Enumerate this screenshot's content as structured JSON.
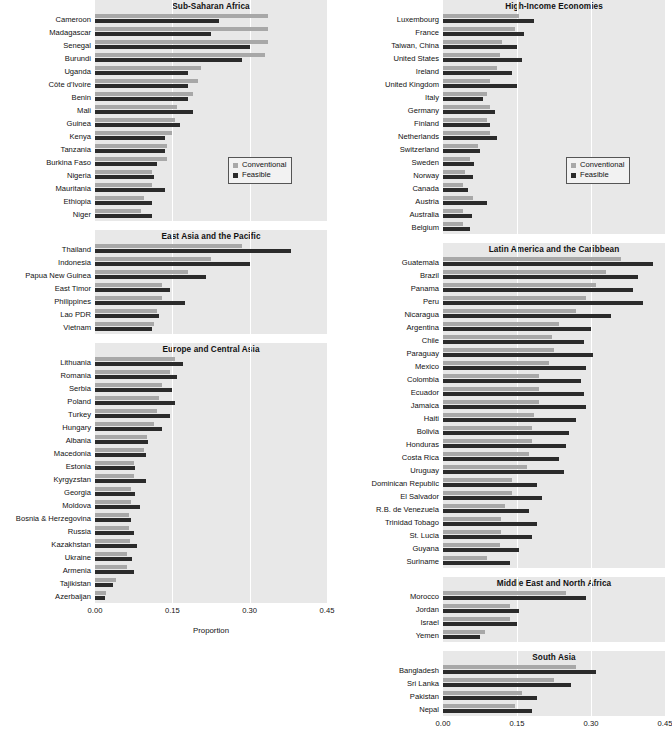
{
  "axis": {
    "xlabel": "Proportion",
    "ticks": [
      "0.00",
      "0.15",
      "0.30",
      "0.45"
    ],
    "tick_values": [
      0,
      0.15,
      0.3,
      0.45
    ],
    "xmin": 0,
    "xmax": 0.45
  },
  "legend": {
    "conventional": "Conventional",
    "feasible": "Feasible"
  },
  "colors": {
    "conventional": "#a8a8a8",
    "feasible": "#2b2b2b",
    "panel_background": "#e8e8e8",
    "gridline": "#ffffff"
  },
  "chart_data": {
    "type": "bar",
    "orientation": "horizontal",
    "title": "",
    "xlabel": "Proportion",
    "ylabel": "",
    "xlim": [
      0,
      0.45
    ],
    "grid": true,
    "legend_position": "inside-right",
    "series_names": [
      "Conventional",
      "Feasible"
    ],
    "panels": [
      {
        "title": "Sub-Saharan Africa",
        "column": "left",
        "categories": [
          "Cameroon",
          "Madagascar",
          "Senegal",
          "Burundi",
          "Uganda",
          "Côte d'Ivoire",
          "Benin",
          "Mali",
          "Guinea",
          "Kenya",
          "Tanzania",
          "Burkina Faso",
          "Nigeria",
          "Mauritania",
          "Ethiopia",
          "Niger"
        ],
        "series": [
          {
            "name": "Conventional",
            "values": [
              0.335,
              0.335,
              0.335,
              0.33,
              0.205,
              0.2,
              0.19,
              0.16,
              0.155,
              0.15,
              0.14,
              0.14,
              0.11,
              0.11,
              0.095,
              0.09
            ]
          },
          {
            "name": "Feasible",
            "values": [
              0.24,
              0.225,
              0.3,
              0.285,
              0.18,
              0.18,
              0.18,
              0.19,
              0.165,
              0.135,
              0.135,
              0.12,
              0.115,
              0.135,
              0.11,
              0.11
            ]
          }
        ]
      },
      {
        "title": "East Asia and the Pacific",
        "column": "left",
        "categories": [
          "Thailand",
          "Indonesia",
          "Papua New Guinea",
          "East Timor",
          "Philippines",
          "Lao PDR",
          "Vietnam"
        ],
        "series": [
          {
            "name": "Conventional",
            "values": [
              0.285,
              0.225,
              0.18,
              0.13,
              0.13,
              0.12,
              0.115
            ]
          },
          {
            "name": "Feasible",
            "values": [
              0.38,
              0.3,
              0.215,
              0.145,
              0.175,
              0.125,
              0.11
            ]
          }
        ]
      },
      {
        "title": "Europe and Central Asia",
        "column": "left",
        "categories": [
          "Lithuania",
          "Romania",
          "Serbia",
          "Poland",
          "Turkey",
          "Hungary",
          "Albania",
          "Macedonia",
          "Estonia",
          "Kyrgyzstan",
          "Georgia",
          "Moldova",
          "Bosnia & Herzegovina",
          "Russia",
          "Kazakhstan",
          "Ukraine",
          "Armenia",
          "Tajikistan",
          "Azerbaijan"
        ],
        "series": [
          {
            "name": "Conventional",
            "values": [
              0.155,
              0.145,
              0.13,
              0.125,
              0.12,
              0.115,
              0.1,
              0.095,
              0.075,
              0.075,
              0.07,
              0.07,
              0.065,
              0.065,
              0.068,
              0.062,
              0.062,
              0.04,
              0.022
            ]
          },
          {
            "name": "Feasible",
            "values": [
              0.17,
              0.16,
              0.15,
              0.155,
              0.145,
              0.13,
              0.102,
              0.098,
              0.078,
              0.098,
              0.078,
              0.088,
              0.07,
              0.075,
              0.082,
              0.072,
              0.075,
              0.035,
              0.02
            ]
          }
        ]
      }
    ],
    "panels_right": [
      {
        "title": "High-Income Economies",
        "column": "right",
        "categories": [
          "Luxembourg",
          "France",
          "Taiwan, China",
          "United States",
          "Ireland",
          "United Kingdom",
          "Italy",
          "Germany",
          "Finland",
          "Netherlands",
          "Switzerland",
          "Sweden",
          "Norway",
          "Canada",
          "Austria",
          "Australia",
          "Belgium"
        ],
        "series": [
          {
            "name": "Conventional",
            "values": [
              0.155,
              0.145,
              0.12,
              0.115,
              0.11,
              0.095,
              0.09,
              0.095,
              0.09,
              0.095,
              0.07,
              0.055,
              0.045,
              0.04,
              0.06,
              0.04,
              0.04
            ]
          },
          {
            "name": "Feasible",
            "values": [
              0.185,
              0.165,
              0.15,
              0.16,
              0.14,
              0.15,
              0.082,
              0.105,
              0.095,
              0.11,
              0.075,
              0.062,
              0.06,
              0.05,
              0.09,
              0.058,
              0.055
            ]
          }
        ]
      },
      {
        "title": "Latin America and the Caribbean",
        "column": "right",
        "categories": [
          "Guatemala",
          "Brazil",
          "Panama",
          "Peru",
          "Nicaragua",
          "Argentina",
          "Chile",
          "Paraguay",
          "Mexico",
          "Colombia",
          "Ecuador",
          "Jamaica",
          "Haiti",
          "Bolivia",
          "Honduras",
          "Costa Rica",
          "Uruguay",
          "Dominican Republic",
          "El Salvador",
          "R.B. de Venezuela",
          "Trinidad Tobago",
          "St. Lucia",
          "Guyana",
          "Suriname"
        ],
        "series": [
          {
            "name": "Conventional",
            "values": [
              0.36,
              0.33,
              0.31,
              0.29,
              0.27,
              0.235,
              0.22,
              0.225,
              0.215,
              0.195,
              0.195,
              0.195,
              0.185,
              0.18,
              0.18,
              0.175,
              0.17,
              0.14,
              0.14,
              0.125,
              0.118,
              0.118,
              0.115,
              0.09
            ]
          },
          {
            "name": "Feasible",
            "values": [
              0.425,
              0.395,
              0.385,
              0.405,
              0.34,
              0.3,
              0.285,
              0.305,
              0.29,
              0.28,
              0.285,
              0.29,
              0.27,
              0.255,
              0.25,
              0.235,
              0.245,
              0.19,
              0.2,
              0.175,
              0.19,
              0.18,
              0.155,
              0.135
            ]
          }
        ]
      },
      {
        "title": "Middle East and North Africa",
        "column": "right",
        "categories": [
          "Morocco",
          "Jordan",
          "Israel",
          "Yemen"
        ],
        "series": [
          {
            "name": "Conventional",
            "values": [
              0.25,
              0.135,
              0.135,
              0.085
            ]
          },
          {
            "name": "Feasible",
            "values": [
              0.29,
              0.155,
              0.15,
              0.075
            ]
          }
        ]
      },
      {
        "title": "South Asia",
        "column": "right",
        "categories": [
          "Bangladesh",
          "Sri Lanka",
          "Pakistan",
          "Nepal"
        ],
        "series": [
          {
            "name": "Conventional",
            "values": [
              0.27,
              0.225,
              0.16,
              0.145
            ]
          },
          {
            "name": "Feasible",
            "values": [
              0.31,
              0.26,
              0.19,
              0.18
            ]
          }
        ]
      }
    ]
  }
}
